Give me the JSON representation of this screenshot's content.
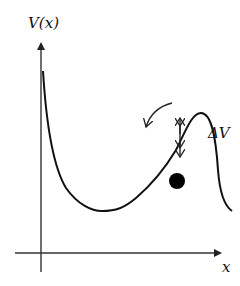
{
  "diagram": {
    "y_axis_label": "V(x)",
    "x_axis_label": "x",
    "barrier_label": "ΔV",
    "elements": {
      "curve": "potential-well-and-barrier",
      "ball": "particle-on-slope",
      "barrier_arrow": "double-headed-vertical-arrow",
      "motion_arrow": "curved-arrow-pointing-downhill"
    },
    "colors": {
      "stroke": "#111111",
      "axis": "#333333",
      "background": "#ffffff"
    }
  }
}
